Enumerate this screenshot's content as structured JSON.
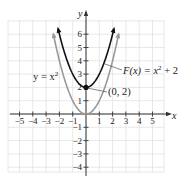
{
  "chart_data": {
    "type": "line",
    "title": "",
    "xlabel": "x",
    "ylabel": "y",
    "xlim": [
      -6,
      6
    ],
    "ylim": [
      -4.5,
      7
    ],
    "grid": true,
    "x_ticks": [
      -5,
      -4,
      -3,
      -2,
      -1,
      1,
      2,
      3,
      4,
      5
    ],
    "y_ticks": [
      -4,
      -3,
      -2,
      -1,
      1,
      2,
      3,
      4,
      5,
      6
    ],
    "x_tick_labels": [
      "−5",
      "−4",
      "−3",
      "−2",
      "−1",
      "1",
      "2",
      "3",
      "4",
      "5"
    ],
    "y_tick_labels": [
      "−4",
      "−3",
      "−2",
      "−1",
      "1",
      "2",
      "3",
      "4",
      "5",
      "6"
    ],
    "series": [
      {
        "name": "y = x²",
        "expression": "x^2",
        "color": "#999999",
        "x_range": [
          -2.45,
          2.45
        ],
        "points": [
          [
            -2.45,
            6.0
          ],
          [
            -2,
            4
          ],
          [
            -1,
            1
          ],
          [
            0,
            0
          ],
          [
            1,
            1
          ],
          [
            2,
            4
          ],
          [
            2.45,
            6.0
          ]
        ]
      },
      {
        "name": "F(x) = x² + 2",
        "expression": "x^2 + 2",
        "color": "#111111",
        "x_range": [
          -2.1,
          2.1
        ],
        "points": [
          [
            -2.1,
            6.41
          ],
          [
            -2,
            6
          ],
          [
            -1,
            3
          ],
          [
            0,
            2
          ],
          [
            1,
            3
          ],
          [
            2,
            6
          ],
          [
            2.1,
            6.41
          ]
        ]
      }
    ],
    "annotations": [
      {
        "text": "y = x²",
        "target": "y = x² curve",
        "position": "left"
      },
      {
        "text": "F(x) = x² + 2",
        "target": "F(x) curve",
        "position": "right",
        "leader_line": true
      },
      {
        "text": "(0, 2)",
        "point": [
          0,
          2
        ],
        "marker": "filled-circle",
        "leader_line": true
      }
    ],
    "legend": null
  },
  "labels": {
    "x_axis": "x",
    "y_axis": "y",
    "eq_base": "y = x",
    "eq_base_exp": "2",
    "eq_shift_prefix": "F(x) = x",
    "eq_shift_exp": "2",
    "eq_shift_suffix": " + 2",
    "point": "(0, 2)"
  },
  "colors": {
    "grid": "#e2e2e2",
    "axis": "#333333",
    "base_curve": "#999999",
    "shifted_curve": "#111111"
  }
}
